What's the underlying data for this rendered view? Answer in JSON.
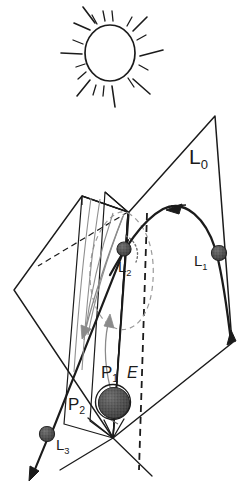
{
  "figure": {
    "background_color": "#ffffff",
    "ink_color": "#1b1b1b",
    "faint_ink_color": "#8a8a8a",
    "sphere_fill_color": "#4a4a4a",
    "width": 249,
    "height": 495
  },
  "sun": {
    "name": "sun",
    "ray_count": 8,
    "short_ray_count": 8
  },
  "labels": {
    "L0": {
      "base": "L",
      "sub": "0"
    },
    "L1": {
      "base": "L",
      "sub": "1"
    },
    "L2": {
      "base": "L",
      "sub": "2"
    },
    "L3": {
      "base": "L",
      "sub": "3"
    },
    "P1": {
      "base": "P",
      "sub": "1"
    },
    "P2": {
      "base": "P",
      "sub": "2"
    },
    "E": {
      "base": "E",
      "sub": ""
    }
  },
  "bodies": [
    {
      "name": "body-L1",
      "label": "L1",
      "cx": 219,
      "cy": 253,
      "r": 7.5
    },
    {
      "name": "body-L2",
      "label": "L2",
      "cx": 124,
      "cy": 249,
      "r": 7.0
    },
    {
      "name": "body-L3",
      "label": "L3",
      "cx": 47,
      "cy": 434,
      "r": 7.5
    },
    {
      "name": "body-earth",
      "label": "E",
      "cx": 114,
      "cy": 403,
      "r": 16.0
    }
  ],
  "planes": [
    {
      "name": "plane-L0",
      "label": "L0"
    },
    {
      "name": "plane-P1",
      "label": "P1"
    },
    {
      "name": "plane-P2",
      "label": "P2"
    }
  ]
}
